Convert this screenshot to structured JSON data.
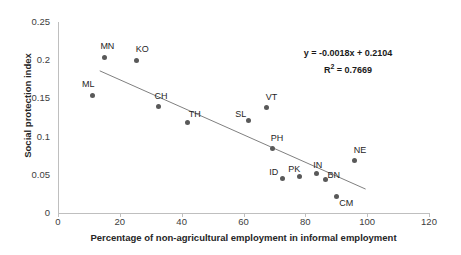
{
  "chart_data": {
    "type": "scatter",
    "title": "",
    "xlabel": "Percentage of non-agricultural employment in informal employment",
    "ylabel": "Social protection index",
    "xlim": [
      0,
      120
    ],
    "ylim": [
      0,
      0.25
    ],
    "xticks": [
      "0",
      "20",
      "40",
      "60",
      "80",
      "100",
      "120"
    ],
    "yticks": [
      "0",
      "0.05",
      "0.1",
      "0.15",
      "0.2",
      "0.25"
    ],
    "grid": false,
    "legend": "none",
    "marker_color": "#595959",
    "trendline_color": "#808080",
    "points": [
      {
        "label": "ML",
        "x": 11.0,
        "y": 0.154
      },
      {
        "label": "MN",
        "x": 15.0,
        "y": 0.204
      },
      {
        "label": "KO",
        "x": 25.5,
        "y": 0.2
      },
      {
        "label": "CH",
        "x": 32.5,
        "y": 0.14
      },
      {
        "label": "TH",
        "x": 42.0,
        "y": 0.118
      },
      {
        "label": "SL",
        "x": 61.5,
        "y": 0.121
      },
      {
        "label": "VT",
        "x": 67.5,
        "y": 0.138
      },
      {
        "label": "PH",
        "x": 69.5,
        "y": 0.085
      },
      {
        "label": "ID",
        "x": 72.5,
        "y": 0.045
      },
      {
        "label": "PK",
        "x": 78.0,
        "y": 0.048
      },
      {
        "label": "IN",
        "x": 83.5,
        "y": 0.052
      },
      {
        "label": "BN",
        "x": 86.5,
        "y": 0.044
      },
      {
        "label": "CM",
        "x": 90.0,
        "y": 0.021
      },
      {
        "label": "NE",
        "x": 96.0,
        "y": 0.069
      }
    ],
    "trendline": {
      "slope": -0.0018,
      "intercept": 0.2104,
      "x_start": 13.5,
      "x_end": 99.5,
      "r_squared": 0.7669
    },
    "annotations": {
      "equation": "y = -0.0018x + 0.2104",
      "r_squared_prefix": "R",
      "r_squared_exponent": "2",
      "r_squared_value": " = 0.7669"
    }
  }
}
